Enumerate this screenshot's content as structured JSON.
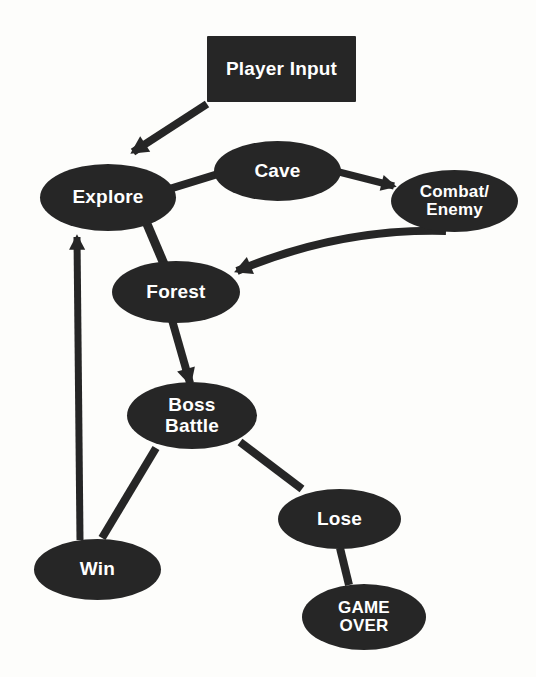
{
  "diagram": {
    "background_color": "#fdfdfb",
    "node_color": "#262626",
    "node_text_color": "#ffffff",
    "edge_color": "#262626",
    "nodes": [
      {
        "id": "player-input",
        "label": "Player Input",
        "shape": "rect",
        "x": 207,
        "y": 36,
        "w": 149,
        "h": 66,
        "font_size": 19
      },
      {
        "id": "explore",
        "label": "Explore",
        "shape": "ellipse",
        "x": 40,
        "y": 164,
        "w": 136,
        "h": 67,
        "font_size": 19
      },
      {
        "id": "cave",
        "label": "Cave",
        "shape": "ellipse",
        "x": 214,
        "y": 141,
        "w": 127,
        "h": 60,
        "font_size": 19
      },
      {
        "id": "combat-enemy",
        "label": "Combat/\nEnemy",
        "shape": "ellipse",
        "x": 391,
        "y": 170,
        "w": 127,
        "h": 62,
        "font_size": 17
      },
      {
        "id": "forest",
        "label": "Forest",
        "shape": "ellipse",
        "x": 112,
        "y": 261,
        "w": 128,
        "h": 62,
        "font_size": 19
      },
      {
        "id": "boss-battle",
        "label": "Boss\nBattle",
        "shape": "ellipse",
        "x": 127,
        "y": 382,
        "w": 130,
        "h": 67,
        "font_size": 19
      },
      {
        "id": "lose",
        "label": "Lose",
        "shape": "ellipse",
        "x": 278,
        "y": 489,
        "w": 123,
        "h": 60,
        "font_size": 19
      },
      {
        "id": "win",
        "label": "Win",
        "shape": "ellipse",
        "x": 34,
        "y": 539,
        "w": 127,
        "h": 61,
        "font_size": 19
      },
      {
        "id": "game-over",
        "label": "GAME\nOVER",
        "shape": "ellipse",
        "x": 302,
        "y": 584,
        "w": 124,
        "h": 66,
        "font_size": 17
      }
    ],
    "edges": [
      {
        "id": "player-input-to-explore",
        "from": "player-input",
        "to": "explore",
        "arrow": true,
        "style": "straight",
        "x1": 207,
        "y1": 104,
        "x2": 133,
        "y2": 152,
        "width": 8
      },
      {
        "id": "explore-to-cave",
        "from": "explore",
        "to": "cave",
        "arrow": false,
        "style": "straight",
        "x1": 166,
        "y1": 190,
        "x2": 218,
        "y2": 174,
        "width": 8
      },
      {
        "id": "cave-to-combat-enemy",
        "from": "cave",
        "to": "combat-enemy",
        "arrow": true,
        "style": "straight",
        "x1": 339,
        "y1": 172,
        "x2": 394,
        "y2": 186,
        "width": 7
      },
      {
        "id": "combat-enemy-to-forest",
        "from": "combat-enemy",
        "to": "forest",
        "arrow": true,
        "style": "curved",
        "x1": 446,
        "y1": 231,
        "x2": 237,
        "y2": 271,
        "cx": 340,
        "cy": 228,
        "width": 8
      },
      {
        "id": "explore-to-forest",
        "from": "explore",
        "to": "forest",
        "arrow": false,
        "style": "straight",
        "x1": 147,
        "y1": 224,
        "x2": 164,
        "y2": 264,
        "width": 9
      },
      {
        "id": "forest-to-boss-battle",
        "from": "forest",
        "to": "boss-battle",
        "arrow": true,
        "style": "straight",
        "x1": 172,
        "y1": 320,
        "x2": 190,
        "y2": 383,
        "width": 8
      },
      {
        "id": "boss-battle-to-win",
        "from": "boss-battle",
        "to": "win",
        "arrow": false,
        "style": "straight",
        "x1": 156,
        "y1": 448,
        "x2": 102,
        "y2": 538,
        "width": 8
      },
      {
        "id": "boss-battle-to-lose",
        "from": "boss-battle",
        "to": "lose",
        "arrow": false,
        "style": "straight",
        "x1": 240,
        "y1": 442,
        "x2": 302,
        "y2": 489,
        "width": 8
      },
      {
        "id": "lose-to-game-over",
        "from": "lose",
        "to": "game-over",
        "arrow": false,
        "style": "straight",
        "x1": 340,
        "y1": 548,
        "x2": 349,
        "y2": 585,
        "width": 8
      },
      {
        "id": "win-to-explore",
        "from": "win",
        "to": "explore",
        "arrow": true,
        "style": "straight",
        "x1": 80,
        "y1": 540,
        "x2": 77,
        "y2": 237,
        "width": 7
      }
    ]
  }
}
